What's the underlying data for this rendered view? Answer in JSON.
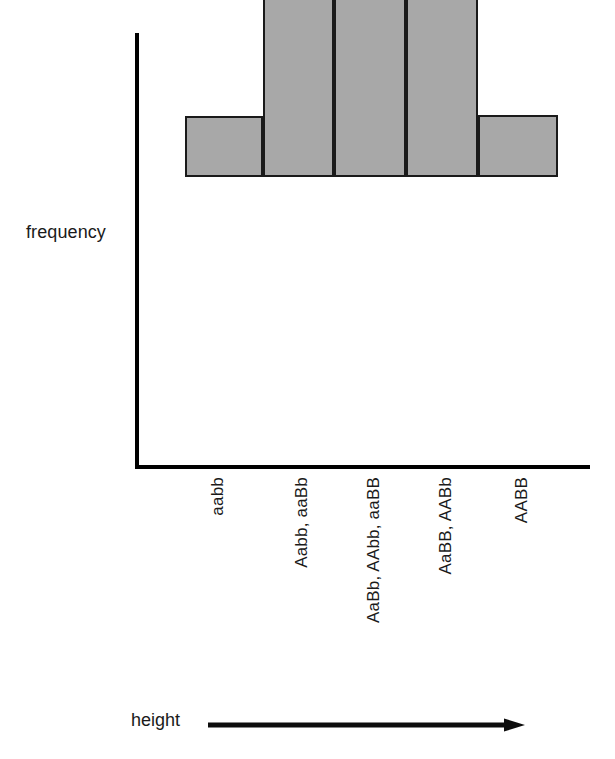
{
  "chart_data": {
    "type": "bar",
    "title": "",
    "subtitle": "",
    "xlabel": "height",
    "ylabel": "frequency",
    "categories": [
      "aabb",
      "Aabb, aaBb",
      "AaBb, AAbb, aaBB",
      "AaBB, AABb",
      "AABB"
    ],
    "values": [
      1,
      4,
      6,
      4,
      1
    ],
    "xlim": null,
    "ylim": [
      0,
      6
    ],
    "grid": false,
    "legend": null,
    "annotations": [],
    "style": {
      "bar_fill": "#a8a8a8",
      "bar_stroke": "#1a1a1a",
      "axis_color": "#000000",
      "background": "#ffffff",
      "text_color": "#1a1a1a"
    },
    "bars": [
      {
        "label": "aabb",
        "value": 1,
        "left_px": 185,
        "width_px": 78,
        "height_px": 61
      },
      {
        "label": "Aabb, aaBb",
        "value": 4,
        "left_px": 263,
        "width_px": 71,
        "height_px": 215
      },
      {
        "label": "AaBb, AAbb, aaBB",
        "value": 6,
        "left_px": 334,
        "width_px": 72,
        "height_px": 421
      },
      {
        "label": "AaBB, AABb",
        "value": 4,
        "left_px": 406,
        "width_px": 72,
        "height_px": 215
      },
      {
        "label": "AABB",
        "value": 1,
        "left_px": 478,
        "width_px": 80,
        "height_px": 62
      }
    ],
    "tick_label_x_px": [
      208,
      292,
      364,
      436,
      512
    ]
  },
  "axes": {
    "y_axis_name": "frequency-axis",
    "x_axis_name": "height-axis",
    "x_axis_arrow": "right-arrow"
  }
}
